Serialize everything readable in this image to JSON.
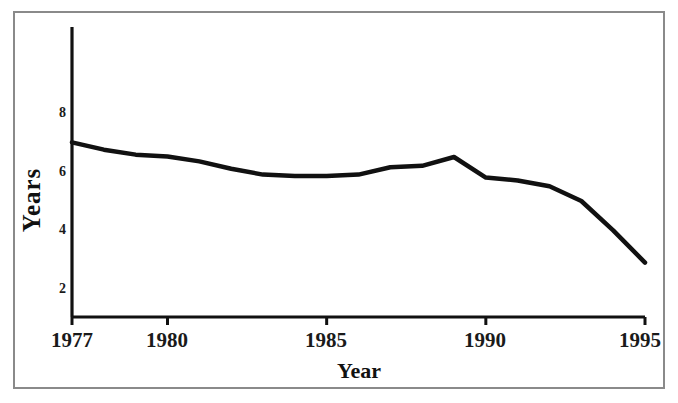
{
  "chart_data": {
    "type": "line",
    "title": "",
    "xlabel": "Year",
    "ylabel": "Years",
    "xlim": [
      1977,
      1995
    ],
    "ylim": [
      1.0,
      9.2
    ],
    "grid": false,
    "legend": null,
    "x_ticks": [
      "1977",
      "1980",
      "1985",
      "1990",
      "1995"
    ],
    "x_tick_values": [
      1977,
      1980,
      1985,
      1990,
      1995
    ],
    "y_ticks": [
      "2",
      "4",
      "6",
      "8"
    ],
    "y_tick_values": [
      2,
      4,
      6,
      8
    ],
    "line_color": "#111111",
    "line_width": 4.5,
    "series": [
      {
        "name": "Years",
        "x": [
          1977,
          1978,
          1979,
          1980,
          1981,
          1982,
          1983,
          1984,
          1985,
          1986,
          1987,
          1988,
          1989,
          1990,
          1991,
          1992,
          1993,
          1994,
          1995
        ],
        "values": [
          7.0,
          6.75,
          6.58,
          6.52,
          6.35,
          6.1,
          5.9,
          5.85,
          5.85,
          5.9,
          6.15,
          6.2,
          6.5,
          5.8,
          5.7,
          5.5,
          5.0,
          4.0,
          2.9
        ]
      }
    ]
  },
  "axes": {
    "y_title": "Years",
    "x_title": "Year"
  },
  "frame": {
    "border_color": "#8a8a8a"
  }
}
